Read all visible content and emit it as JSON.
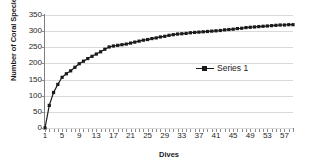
{
  "chart_data": {
    "type": "line",
    "title": "",
    "subtitle": "",
    "xlabel": "Dives",
    "ylabel": "Number of Coral Species",
    "xlim": [
      1,
      59
    ],
    "ylim": [
      0,
      350
    ],
    "ytick_step": 50,
    "xtick_step": 4,
    "grid": true,
    "legend_position": "inside-right",
    "marker": "square",
    "line_color": "#1a1a1a",
    "grid_color": "#d9d9d9",
    "axis_color": "#808080",
    "y_ticks": [
      0,
      50,
      100,
      150,
      200,
      250,
      300,
      350
    ],
    "x_ticks": [
      1,
      5,
      9,
      13,
      17,
      21,
      25,
      29,
      33,
      37,
      41,
      45,
      49,
      53,
      57
    ],
    "series": [
      {
        "name": "Series 1",
        "x": [
          1,
          2,
          3,
          4,
          5,
          6,
          7,
          8,
          9,
          10,
          11,
          12,
          13,
          14,
          15,
          16,
          17,
          18,
          19,
          20,
          21,
          22,
          23,
          24,
          25,
          26,
          27,
          28,
          29,
          30,
          31,
          32,
          33,
          34,
          35,
          36,
          37,
          38,
          39,
          40,
          41,
          42,
          43,
          44,
          45,
          46,
          47,
          48,
          49,
          50,
          51,
          52,
          53,
          54,
          55,
          56,
          57,
          58,
          59
        ],
        "values": [
          0,
          70,
          110,
          135,
          157,
          168,
          177,
          188,
          199,
          207,
          215,
          222,
          229,
          236,
          244,
          251,
          254,
          256,
          258,
          260,
          263,
          266,
          269,
          272,
          274,
          277,
          279,
          282,
          284,
          287,
          289,
          291,
          292,
          293,
          295,
          296,
          297,
          298,
          299,
          300,
          301,
          302,
          304,
          305,
          306,
          308,
          309,
          311,
          312,
          313,
          314,
          315,
          316,
          317,
          318,
          319,
          319,
          320,
          320
        ]
      }
    ]
  },
  "legend": {
    "entries": [
      {
        "label": "Series 1"
      }
    ]
  },
  "axes": {
    "y_title": "Number of Coral Species",
    "x_title": "Dives"
  }
}
